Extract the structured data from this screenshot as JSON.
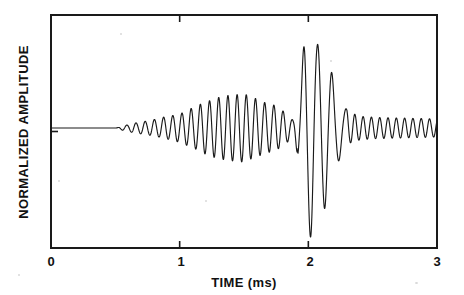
{
  "figure": {
    "background_color": "#ffffff",
    "line_color": "#1a1a1a",
    "axis_color": "#1a1a1a"
  },
  "axes": {
    "x_axis_title": "TIME (ms)",
    "y_axis_title": "NORMALIZED AMPLITUDE",
    "x_tick_labels": [
      "0",
      "1",
      "2",
      "3"
    ],
    "y_tick_labels": []
  },
  "chart_data": {
    "type": "line",
    "title": "",
    "xlabel": "TIME (ms)",
    "ylabel": "NORMALIZED AMPLITUDE",
    "xlim": [
      0,
      3
    ],
    "ylim": [
      -1.35,
      1.35
    ],
    "xticks": [
      0,
      1,
      2,
      3
    ],
    "xtick_labels": [
      "0",
      "1",
      "2",
      "3"
    ],
    "yticks": [],
    "grid": false,
    "legend": null,
    "tick_direction": "in",
    "frame": "box",
    "series": [
      {
        "name": "normalized amplitude",
        "envelope_breakpoints": {
          "comment": "time_ms -> envelope magnitude in normalized amplitude units",
          "t": [
            0.0,
            0.5,
            0.58,
            0.66,
            0.74,
            0.82,
            0.9,
            1.0,
            1.1,
            1.2,
            1.3,
            1.4,
            1.5,
            1.58,
            1.66,
            1.74,
            1.82,
            1.88,
            1.93,
            1.98,
            2.02,
            2.07,
            2.12,
            2.17,
            2.22,
            2.28,
            2.34,
            2.42,
            2.55,
            2.7,
            2.85,
            3.0
          ],
          "a": [
            0.0,
            0.0,
            0.03,
            0.055,
            0.075,
            0.105,
            0.15,
            0.21,
            0.255,
            0.3,
            0.33,
            0.345,
            0.36,
            0.33,
            0.3,
            0.29,
            0.23,
            0.12,
            0.42,
            1.0,
            1.15,
            0.88,
            0.86,
            0.62,
            0.38,
            0.21,
            0.15,
            0.12,
            0.11,
            0.105,
            0.1,
            0.095
          ]
        },
        "carrier_frequency_khz": 14.0,
        "beat_frequency_khz": 1.15,
        "points_note": "Waveform reconstructed parametrically from the envelope breakpoints and carrier/beat frequencies above."
      }
    ]
  },
  "geometry": {
    "plot_left_px": 51,
    "plot_right_px": 437,
    "plot_top_px": 15,
    "plot_bottom_px": 248,
    "baseline_px": 128
  }
}
